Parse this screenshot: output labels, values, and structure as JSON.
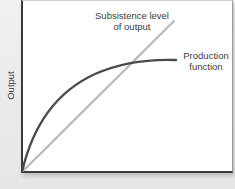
{
  "diagram": {
    "y_axis_label": "Output",
    "x_axis_label": "",
    "lines": [
      {
        "name": "Subsistence level of output",
        "label_line1": "Subsistence level",
        "label_line2": "of output",
        "shape": "straight line from origin",
        "color": "#b5b5b5"
      },
      {
        "name": "Production function",
        "label_line1": "Production",
        "label_line2": "function",
        "shape": "concave curve from origin, flattening",
        "color": "#4a4a4a"
      }
    ],
    "intersection": "Production function crosses subsistence line at upper middle"
  },
  "colors": {
    "background": "#ececec",
    "plot_area": "#ffffff",
    "axis": "#3a3a3a",
    "subsistence_line": "#b5b5b5",
    "production_curve": "#4a4a4a",
    "text": "#3b3b3b"
  }
}
